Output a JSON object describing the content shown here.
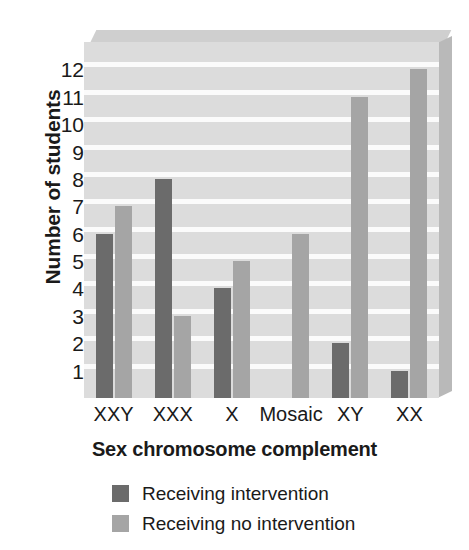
{
  "chart_data": {
    "type": "bar",
    "title": "",
    "xlabel": "Sex chromosome complement",
    "ylabel": "Number of students",
    "categories": [
      "XXY",
      "XXX",
      "X",
      "Mosaic",
      "XY",
      "XX"
    ],
    "series": [
      {
        "name": "Receiving intervention",
        "color": "#6b6b6b",
        "values": [
          6,
          8,
          4,
          0,
          2,
          1
        ]
      },
      {
        "name": "Receiving no intervention",
        "color": "#a5a5a5",
        "values": [
          7,
          3,
          5,
          6,
          11,
          12
        ]
      }
    ],
    "ylim": [
      0,
      13
    ],
    "yticks": [
      1,
      2,
      3,
      4,
      5,
      6,
      7,
      8,
      9,
      10,
      11,
      12
    ],
    "ytick_labels": [
      "1",
      "2",
      "3",
      "4",
      "5",
      "6",
      "7",
      "8",
      "9",
      "10",
      "11",
      "12"
    ],
    "grid": true,
    "grid_color": "#fbfbfb",
    "plot_background": "#dcdcdc",
    "legend_position": "bottom-left"
  }
}
